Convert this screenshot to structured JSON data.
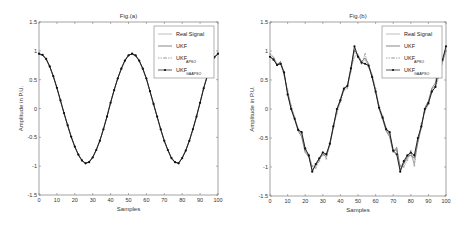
{
  "chart_data": [
    {
      "type": "line",
      "title": "Fig.(a)",
      "xlabel": "Samples",
      "ylabel": "Amplitude in P.U.",
      "xlim": [
        0,
        100
      ],
      "ylim": [
        -1.5,
        1.5
      ],
      "xticks": [
        "0",
        "10",
        "20",
        "30",
        "40",
        "50",
        "60",
        "70",
        "80",
        "90",
        "100"
      ],
      "yticks": [
        "-1.5",
        "-1",
        "-0.5",
        "0",
        "0.5",
        "1",
        "1.5"
      ],
      "grid": false,
      "legend_position": "top-right",
      "x": [
        0,
        2,
        4,
        6,
        8,
        10,
        12,
        14,
        16,
        18,
        20,
        22,
        24,
        26,
        28,
        30,
        32,
        34,
        36,
        38,
        40,
        42,
        44,
        46,
        48,
        50,
        52,
        54,
        56,
        58,
        60,
        62,
        64,
        66,
        68,
        70,
        72,
        74,
        76,
        78,
        80,
        82,
        84,
        86,
        88,
        90,
        92,
        94,
        96,
        98,
        100
      ],
      "series": [
        {
          "name": "Real Signal",
          "legend_main": "Real Signal",
          "legend_sub": "",
          "color": "#a0a0a0",
          "marker": "none",
          "values": [
            0.95,
            0.93,
            0.86,
            0.73,
            0.56,
            0.36,
            0.14,
            -0.08,
            -0.29,
            -0.49,
            -0.66,
            -0.8,
            -0.9,
            -0.95,
            -0.93,
            -0.85,
            -0.72,
            -0.56,
            -0.36,
            -0.14,
            0.1,
            0.32,
            0.52,
            0.69,
            0.83,
            0.92,
            0.95,
            0.92,
            0.83,
            0.69,
            0.52,
            0.3,
            0.08,
            -0.14,
            -0.36,
            -0.56,
            -0.72,
            -0.86,
            -0.93,
            -0.95,
            -0.86,
            -0.73,
            -0.56,
            -0.36,
            -0.14,
            0.1,
            0.35,
            0.56,
            0.75,
            0.89,
            0.95
          ]
        },
        {
          "name": "UKF",
          "legend_main": "UKF",
          "legend_sub": "",
          "color": "#555555",
          "marker": "none",
          "values": [
            0.94,
            0.92,
            0.85,
            0.72,
            0.55,
            0.35,
            0.13,
            -0.09,
            -0.3,
            -0.5,
            -0.67,
            -0.81,
            -0.91,
            -0.95,
            -0.92,
            -0.84,
            -0.71,
            -0.55,
            -0.35,
            -0.13,
            0.11,
            0.33,
            0.53,
            0.7,
            0.84,
            0.93,
            0.94,
            0.91,
            0.82,
            0.68,
            0.51,
            0.29,
            0.07,
            -0.15,
            -0.37,
            -0.57,
            -0.73,
            -0.87,
            -0.94,
            -0.94,
            -0.85,
            -0.72,
            -0.55,
            -0.35,
            -0.13,
            0.11,
            0.36,
            0.57,
            0.76,
            0.9,
            0.94
          ]
        },
        {
          "name": "UKF_APSO",
          "legend_main": "UKF",
          "legend_sub": "APSO",
          "color": "#888888",
          "marker": "plus",
          "values": [
            0.95,
            0.93,
            0.86,
            0.73,
            0.56,
            0.36,
            0.14,
            -0.08,
            -0.29,
            -0.49,
            -0.66,
            -0.8,
            -0.9,
            -0.95,
            -0.93,
            -0.85,
            -0.72,
            -0.56,
            -0.36,
            -0.14,
            0.1,
            0.32,
            0.52,
            0.69,
            0.83,
            0.92,
            0.95,
            0.92,
            0.83,
            0.69,
            0.52,
            0.3,
            0.08,
            -0.14,
            -0.36,
            -0.56,
            -0.72,
            -0.86,
            -0.93,
            -0.95,
            -0.86,
            -0.73,
            -0.56,
            -0.36,
            -0.14,
            0.1,
            0.35,
            0.56,
            0.75,
            0.89,
            0.95
          ]
        },
        {
          "name": "UKF_GAAPSO",
          "legend_main": "UKF",
          "legend_sub": "GAAPSO",
          "color": "#111111",
          "marker": "dot",
          "values": [
            0.95,
            0.93,
            0.86,
            0.73,
            0.56,
            0.36,
            0.14,
            -0.08,
            -0.29,
            -0.49,
            -0.66,
            -0.8,
            -0.9,
            -0.95,
            -0.93,
            -0.85,
            -0.72,
            -0.56,
            -0.36,
            -0.14,
            0.1,
            0.32,
            0.52,
            0.69,
            0.83,
            0.92,
            0.95,
            0.92,
            0.83,
            0.69,
            0.52,
            0.3,
            0.08,
            -0.14,
            -0.36,
            -0.56,
            -0.72,
            -0.86,
            -0.93,
            -0.95,
            -0.86,
            -0.73,
            -0.56,
            -0.36,
            -0.14,
            0.1,
            0.35,
            0.56,
            0.75,
            0.89,
            0.95
          ]
        }
      ]
    },
    {
      "type": "line",
      "title": "Fig.(b)",
      "xlabel": "Samples",
      "ylabel": "Amplitude in P.U.",
      "xlim": [
        0,
        100
      ],
      "ylim": [
        -1.5,
        1.5
      ],
      "xticks": [
        "0",
        "10",
        "20",
        "30",
        "40",
        "50",
        "60",
        "70",
        "80",
        "90",
        "100"
      ],
      "yticks": [
        "-1.5",
        "-1",
        "-0.5",
        "0",
        "0.5",
        "1",
        "1.5"
      ],
      "grid": false,
      "legend_position": "top-right",
      "x": [
        0,
        2,
        4,
        6,
        8,
        10,
        12,
        14,
        16,
        18,
        20,
        22,
        24,
        26,
        28,
        30,
        32,
        34,
        36,
        38,
        40,
        42,
        44,
        46,
        48,
        50,
        52,
        54,
        56,
        58,
        60,
        62,
        64,
        66,
        68,
        70,
        72,
        74,
        76,
        78,
        80,
        82,
        84,
        86,
        88,
        90,
        92,
        94,
        96,
        98,
        100
      ],
      "series": [
        {
          "name": "Real Signal",
          "legend_main": "Real Signal",
          "legend_sub": "",
          "color": "#a0a0a0",
          "marker": "none",
          "values": [
            0.95,
            0.9,
            0.78,
            0.8,
            0.6,
            0.3,
            0.05,
            -0.15,
            -0.35,
            -0.45,
            -0.72,
            -0.8,
            -1.0,
            -0.95,
            -0.85,
            -0.8,
            -0.78,
            -0.6,
            -0.3,
            -0.05,
            0.15,
            0.35,
            0.38,
            0.7,
            0.9,
            0.95,
            0.8,
            0.85,
            0.75,
            0.6,
            0.32,
            0.02,
            -0.15,
            -0.35,
            -0.45,
            -0.72,
            -0.7,
            -1.0,
            -0.92,
            -0.85,
            -0.75,
            -0.95,
            -0.55,
            -0.3,
            0.0,
            0.1,
            0.35,
            0.4,
            0.6,
            0.8,
            1.0
          ]
        },
        {
          "name": "UKF",
          "legend_main": "UKF",
          "legend_sub": "",
          "color": "#555555",
          "marker": "none",
          "values": [
            0.9,
            0.86,
            0.76,
            0.82,
            0.62,
            0.28,
            0.0,
            -0.18,
            -0.38,
            -0.48,
            -0.75,
            -0.82,
            -1.05,
            -0.98,
            -0.86,
            -0.78,
            -0.82,
            -0.62,
            -0.32,
            -0.02,
            0.18,
            0.36,
            0.4,
            0.72,
            1.02,
            0.92,
            0.82,
            0.88,
            0.78,
            0.55,
            0.3,
            0.0,
            -0.18,
            -0.38,
            -0.48,
            -0.75,
            -0.66,
            -1.05,
            -0.95,
            -0.82,
            -0.8,
            -0.85,
            -0.58,
            -0.32,
            0.02,
            0.14,
            0.36,
            0.45,
            0.78,
            0.85,
            1.02
          ]
        },
        {
          "name": "UKF_APSO",
          "legend_main": "UKF",
          "legend_sub": "APSO",
          "color": "#888888",
          "marker": "plus",
          "values": [
            0.95,
            0.88,
            0.75,
            0.78,
            0.58,
            0.32,
            0.06,
            -0.14,
            -0.34,
            -0.42,
            -0.7,
            -0.78,
            -0.98,
            -1.02,
            -0.9,
            -0.74,
            -0.86,
            -0.58,
            -0.28,
            -0.08,
            0.12,
            0.32,
            0.36,
            0.65,
            1.0,
            0.9,
            0.78,
            0.95,
            0.72,
            0.58,
            0.35,
            0.05,
            -0.12,
            -0.33,
            -0.42,
            -0.7,
            -0.72,
            -0.98,
            -1.0,
            -0.88,
            -0.72,
            -0.98,
            -0.55,
            -0.25,
            -0.05,
            0.08,
            0.32,
            0.38,
            0.55,
            0.82,
            1.0
          ]
        },
        {
          "name": "UKF_GAAPSO",
          "legend_main": "UKF",
          "legend_sub": "GAAPSO",
          "color": "#111111",
          "marker": "dot",
          "values": [
            0.9,
            0.85,
            0.76,
            0.78,
            0.63,
            0.25,
            0.0,
            -0.17,
            -0.36,
            -0.4,
            -0.68,
            -0.8,
            -1.08,
            -0.95,
            -0.85,
            -0.75,
            -0.78,
            -0.6,
            -0.3,
            0.0,
            0.15,
            0.35,
            0.4,
            0.7,
            1.08,
            0.9,
            0.8,
            0.78,
            0.75,
            0.55,
            0.3,
            0.02,
            -0.15,
            -0.35,
            -0.4,
            -0.72,
            -0.78,
            -1.08,
            -0.9,
            -0.8,
            -0.75,
            -0.8,
            -0.5,
            -0.3,
            0.0,
            0.1,
            0.3,
            0.38,
            0.75,
            0.85,
            1.08
          ]
        }
      ]
    }
  ]
}
